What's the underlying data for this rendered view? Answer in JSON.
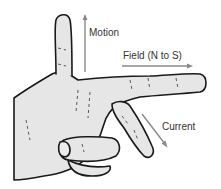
{
  "diagram": {
    "labels": {
      "motion": "Motion",
      "field": "Field (N to S)",
      "current": "Current"
    },
    "arrows": [
      {
        "name": "motion",
        "direction": "up",
        "from": [
          85,
          72
        ],
        "to": [
          85,
          15
        ]
      },
      {
        "name": "field",
        "direction": "right",
        "from": [
          122,
          66
        ],
        "to": [
          193,
          66
        ]
      },
      {
        "name": "current",
        "direction": "down-right",
        "from": [
          142,
          114
        ],
        "to": [
          167,
          147
        ]
      }
    ],
    "colors": {
      "hand_fill": "#e6e6e6",
      "outline": "#1a1a1a",
      "arrow": "#8a8a8a",
      "text": "#333333",
      "background": "#ffffff"
    }
  }
}
